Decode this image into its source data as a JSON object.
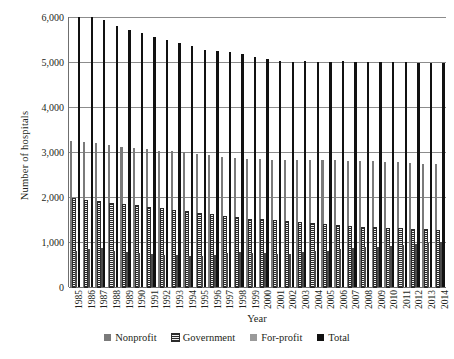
{
  "chart_data": {
    "type": "bar",
    "title": "",
    "xlabel": "Year",
    "ylabel": "Number of hospitals",
    "ylim": [
      0,
      6000
    ],
    "yticks": [
      0,
      1000,
      2000,
      3000,
      4000,
      5000,
      6000
    ],
    "ytick_labels": [
      "0",
      "1,000",
      "2,000",
      "3,000",
      "4,000",
      "5,000",
      "6,000"
    ],
    "grid": true,
    "legend_position": "bottom",
    "categories": [
      "1985",
      "1986",
      "1987",
      "1988",
      "1989",
      "1990",
      "1991",
      "1992",
      "1993",
      "1994",
      "1995",
      "1996",
      "1997",
      "1998",
      "1999",
      "2000",
      "2001",
      "2002",
      "2003",
      "2004",
      "2005",
      "2006",
      "2007",
      "2008",
      "2009",
      "2010",
      "2011",
      "2012",
      "2013",
      "2014"
    ],
    "series": [
      {
        "name": "Nonprofit",
        "color": "#7a7a7a",
        "values": [
          3250,
          3230,
          3190,
          3145,
          3115,
          3100,
          3060,
          3030,
          3020,
          2995,
          2960,
          2930,
          2900,
          2870,
          2850,
          2840,
          2830,
          2820,
          2830,
          2820,
          2815,
          2825,
          2810,
          2800,
          2790,
          2780,
          2770,
          2755,
          2740,
          2730
        ]
      },
      {
        "name": "Government",
        "color": "#2b2b2b",
        "values": [
          1950,
          1920,
          1885,
          1855,
          1825,
          1790,
          1760,
          1730,
          1700,
          1665,
          1620,
          1595,
          1565,
          1530,
          1500,
          1480,
          1460,
          1440,
          1420,
          1400,
          1380,
          1360,
          1340,
          1320,
          1310,
          1295,
          1280,
          1270,
          1260,
          1250
        ]
      },
      {
        "name": "For-profit",
        "color": "#4a4a4a",
        "values": [
          805,
          850,
          860,
          800,
          770,
          750,
          740,
          720,
          710,
          700,
          695,
          720,
          750,
          770,
          760,
          750,
          740,
          730,
          770,
          790,
          810,
          840,
          860,
          880,
          900,
          920,
          940,
          960,
          980,
          1000
        ]
      },
      {
        "name": "Total",
        "color": "#111111",
        "values": [
          6005,
          6000,
          5935,
          5800,
          5710,
          5640,
          5560,
          5480,
          5430,
          5360,
          5275,
          5245,
          5215,
          5170,
          5110,
          5070,
          5030,
          4990,
          5020,
          5010,
          5005,
          5025,
          5010,
          5000,
          5000,
          4995,
          4990,
          4985,
          4980,
          4980
        ]
      }
    ],
    "legend": [
      {
        "label": "Nonprofit",
        "marker": "solid-dark-gray-square"
      },
      {
        "label": "Government",
        "marker": "hatched-square"
      },
      {
        "label": "For-profit",
        "marker": "solid-light-gray-square"
      },
      {
        "label": "Total",
        "marker": "solid-black-square"
      }
    ]
  }
}
